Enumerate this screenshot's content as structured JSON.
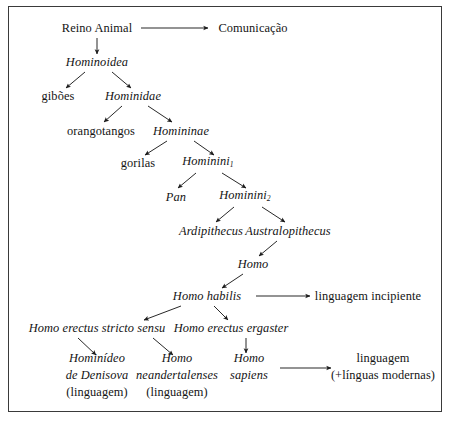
{
  "figure": {
    "kind": "cladogram",
    "title_visible": false,
    "background": "#ffffff",
    "frame_color": "#3a3a3a",
    "text_color": "#141414",
    "arrow_color": "#1c1c1c"
  },
  "nodes": [
    {
      "id": "reino_animal",
      "label": "Reino Animal",
      "style": "roman",
      "x": 97,
      "y": 28
    },
    {
      "id": "comunicacao",
      "label": "Comunicação",
      "style": "roman",
      "x": 253,
      "y": 28
    },
    {
      "id": "hominoidea",
      "label": "Hominoidea",
      "style": "italic",
      "x": 97,
      "y": 62
    },
    {
      "id": "giboes",
      "label": "gibões",
      "style": "roman",
      "x": 58,
      "y": 96
    },
    {
      "id": "hominidae",
      "label": "Hominidae",
      "style": "italic",
      "x": 133,
      "y": 96
    },
    {
      "id": "orangotangos",
      "label": "orangotangos",
      "style": "roman",
      "x": 101,
      "y": 131
    },
    {
      "id": "homininae",
      "label": "Homininae",
      "style": "italic",
      "x": 181,
      "y": 131
    },
    {
      "id": "gorilas",
      "label": "gorilas",
      "style": "roman",
      "x": 138,
      "y": 163
    },
    {
      "id": "hominini_1",
      "label": "Hominini",
      "style": "italic",
      "sub": "1",
      "x": 208,
      "y": 163
    },
    {
      "id": "pan",
      "label": "Pan",
      "style": "italic",
      "x": 176,
      "y": 197
    },
    {
      "id": "hominini_2",
      "label": "Hominini",
      "style": "italic",
      "sub": "2",
      "x": 245,
      "y": 197
    },
    {
      "id": "ardipithecus",
      "label": "Ardipithecus",
      "style": "italic",
      "x": 211,
      "y": 231
    },
    {
      "id": "australopithecus",
      "label": "Australopithecus",
      "style": "italic",
      "x": 288,
      "y": 231
    },
    {
      "id": "homo",
      "label": "Homo",
      "style": "italic",
      "x": 253,
      "y": 264
    },
    {
      "id": "homo_habilis",
      "label": "Homo habilis",
      "style": "italic",
      "x": 207,
      "y": 296
    },
    {
      "id": "linguagem_incipiente",
      "label": "linguagem incipiente",
      "style": "roman",
      "x": 368,
      "y": 296
    },
    {
      "id": "homo_erectus_stricto_sensu",
      "label": "Homo erectus stricto sensu",
      "style": "italic",
      "x": 97,
      "y": 328
    },
    {
      "id": "homo_erectus_ergaster",
      "label": "Homo erectus ergaster",
      "style": "italic",
      "x": 231,
      "y": 328
    }
  ],
  "leaf_nodes": [
    {
      "id": "hominideo_denisova",
      "x": 97,
      "y": 375,
      "lines": [
        {
          "text": "Hominídeo",
          "style": "italic"
        },
        {
          "text": "de Denisova",
          "style": "italic"
        },
        {
          "text": "(linguagem)",
          "style": "roman"
        }
      ]
    },
    {
      "id": "homo_neandertalenses",
      "x": 177,
      "y": 375,
      "lines": [
        {
          "text": "Homo",
          "style": "italic"
        },
        {
          "text": "neandertalenses",
          "style": "italic"
        },
        {
          "text": "(linguagem)",
          "style": "roman"
        }
      ]
    },
    {
      "id": "homo_sapiens",
      "x": 249,
      "y": 367,
      "lines": [
        {
          "text": "Homo",
          "style": "italic"
        },
        {
          "text": "sapiens",
          "style": "italic"
        }
      ]
    },
    {
      "id": "linguagem_modernas",
      "x": 383,
      "y": 367,
      "lines": [
        {
          "text": "linguagem",
          "style": "roman"
        },
        {
          "text": "(+línguas modernas)",
          "style": "roman"
        }
      ]
    }
  ],
  "edges": [
    {
      "id": "reino-to-comunicacao",
      "from": "reino_animal",
      "to": "comunicacao",
      "kind": "horizontal",
      "x1": 141,
      "y1": 28,
      "x2": 208,
      "y2": 28
    },
    {
      "id": "reino-to-hominoidea",
      "from": "reino_animal",
      "to": "hominoidea",
      "kind": "vertical",
      "x1": 97,
      "y1": 38,
      "x2": 97,
      "y2": 54
    },
    {
      "id": "hominoidea-to-giboes",
      "from": "hominoidea",
      "to": "giboes",
      "kind": "diagonal",
      "x1": 85,
      "y1": 72,
      "x2": 66,
      "y2": 88
    },
    {
      "id": "hominoidea-to-hominidae",
      "from": "hominoidea",
      "to": "hominidae",
      "kind": "diagonal",
      "x1": 112,
      "y1": 72,
      "x2": 131,
      "y2": 88
    },
    {
      "id": "hominidae-to-orangotangos",
      "from": "hominidae",
      "to": "orangotangos",
      "kind": "diagonal",
      "x1": 122,
      "y1": 106,
      "x2": 104,
      "y2": 122
    },
    {
      "id": "hominidae-to-homininae",
      "from": "hominidae",
      "to": "homininae",
      "kind": "diagonal",
      "x1": 148,
      "y1": 106,
      "x2": 172,
      "y2": 122
    },
    {
      "id": "homininae-to-gorilas",
      "from": "homininae",
      "to": "gorilas",
      "kind": "diagonal",
      "x1": 167,
      "y1": 141,
      "x2": 145,
      "y2": 155
    },
    {
      "id": "homininae-to-hominini1",
      "from": "homininae",
      "to": "hominini_1",
      "kind": "diagonal",
      "x1": 194,
      "y1": 141,
      "x2": 214,
      "y2": 155
    },
    {
      "id": "hominini1-to-pan",
      "from": "hominini_1",
      "to": "pan",
      "kind": "diagonal",
      "x1": 196,
      "y1": 173,
      "x2": 178,
      "y2": 188
    },
    {
      "id": "hominini1-to-hominini2",
      "from": "hominini_1",
      "to": "hominini_2",
      "kind": "diagonal",
      "x1": 222,
      "y1": 173,
      "x2": 246,
      "y2": 188
    },
    {
      "id": "hominini2-to-ardipithecus",
      "from": "hominini_2",
      "to": "ardipithecus",
      "kind": "diagonal",
      "x1": 234,
      "y1": 207,
      "x2": 216,
      "y2": 222
    },
    {
      "id": "hominini2-to-australopithecus",
      "from": "hominini_2",
      "to": "australopithecus",
      "kind": "diagonal",
      "x1": 262,
      "y1": 207,
      "x2": 285,
      "y2": 222
    },
    {
      "id": "australopithecus-to-homo",
      "from": "australopithecus",
      "to": "homo",
      "kind": "diagonal",
      "x1": 277,
      "y1": 241,
      "x2": 259,
      "y2": 256
    },
    {
      "id": "homo-to-homo-habilis",
      "from": "homo",
      "to": "homo_habilis",
      "kind": "diagonal",
      "x1": 243,
      "y1": 274,
      "x2": 222,
      "y2": 288
    },
    {
      "id": "habilis-to-linguagem-incipiente",
      "from": "homo_habilis",
      "to": "linguagem_incipiente",
      "kind": "horizontal",
      "x1": 256,
      "y1": 296,
      "x2": 310,
      "y2": 296
    },
    {
      "id": "habilis-to-erectus-stricto",
      "from": "homo_habilis",
      "to": "homo_erectus_stricto_sensu",
      "kind": "diagonal",
      "x1": 181,
      "y1": 306,
      "x2": 144,
      "y2": 320
    },
    {
      "id": "habilis-to-erectus-ergaster",
      "from": "homo_habilis",
      "to": "homo_erectus_ergaster",
      "kind": "diagonal",
      "x1": 214,
      "y1": 306,
      "x2": 228,
      "y2": 320
    },
    {
      "id": "stricto-to-denisova",
      "from": "homo_erectus_stricto_sensu",
      "to": "hominideo_denisova",
      "kind": "diagonal",
      "x1": 78,
      "y1": 338,
      "x2": 96,
      "y2": 355
    },
    {
      "id": "stricto-to-neandertalenses",
      "from": "homo_erectus_stricto_sensu",
      "to": "homo_neandertalenses",
      "kind": "diagonal",
      "x1": 153,
      "y1": 338,
      "x2": 173,
      "y2": 355
    },
    {
      "id": "ergaster-to-sapiens",
      "from": "homo_erectus_ergaster",
      "to": "homo_sapiens",
      "kind": "vertical",
      "x1": 246,
      "y1": 338,
      "x2": 246,
      "y2": 353
    },
    {
      "id": "sapiens-to-linguagem-modernas",
      "from": "homo_sapiens",
      "to": "linguagem_modernas",
      "kind": "horizontal",
      "x1": 280,
      "y1": 368,
      "x2": 331,
      "y2": 368
    }
  ]
}
